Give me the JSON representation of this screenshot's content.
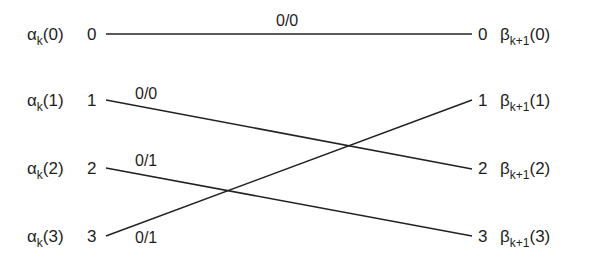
{
  "diagram": {
    "type": "trellis-section",
    "left_nodes": [
      {
        "symbol": "α",
        "sub": "k",
        "arg": "(0)",
        "state": "0"
      },
      {
        "symbol": "α",
        "sub": "k",
        "arg": "(1)",
        "state": "1"
      },
      {
        "symbol": "α",
        "sub": "k",
        "arg": "(2)",
        "state": "2"
      },
      {
        "symbol": "α",
        "sub": "k",
        "arg": "(3)",
        "state": "3"
      }
    ],
    "right_nodes": [
      {
        "symbol": "β",
        "sub": "k+1",
        "arg": "(0)",
        "state": "0"
      },
      {
        "symbol": "β",
        "sub": "k+1",
        "arg": "(1)",
        "state": "1"
      },
      {
        "symbol": "β",
        "sub": "k+1",
        "arg": "(2)",
        "state": "2"
      },
      {
        "symbol": "β",
        "sub": "k+1",
        "arg": "(3)",
        "state": "3"
      }
    ],
    "edges": [
      {
        "from": "0",
        "to": "0",
        "label": "0/0"
      },
      {
        "from": "1",
        "to": "2",
        "label": "0/0"
      },
      {
        "from": "2",
        "to": "3",
        "label": "0/1"
      },
      {
        "from": "3",
        "to": "1",
        "label": "0/1"
      }
    ]
  }
}
